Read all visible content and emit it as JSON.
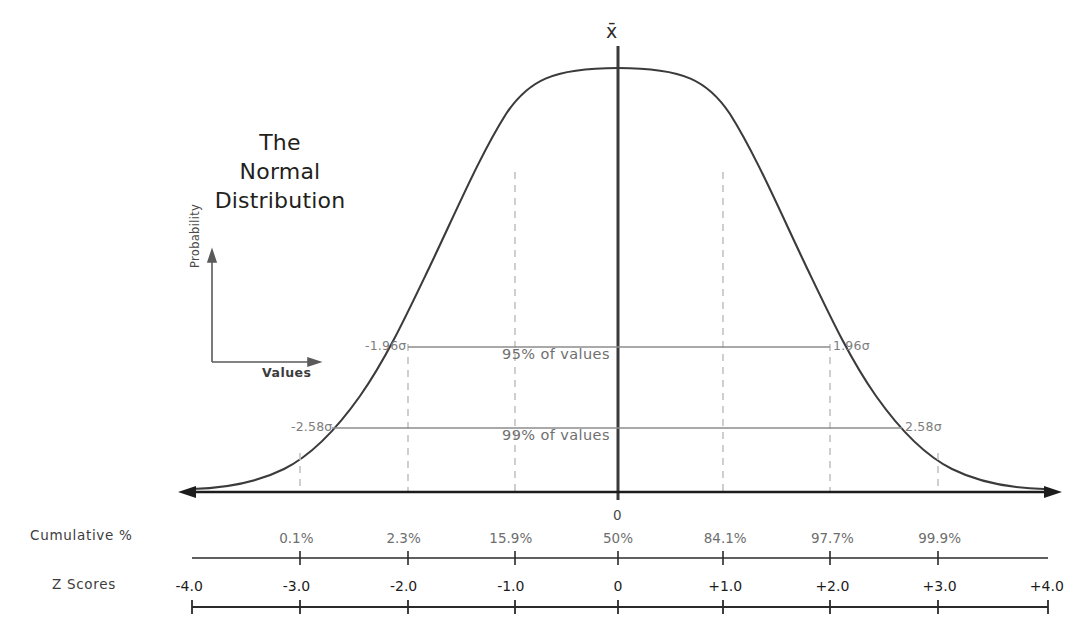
{
  "title": {
    "line1": "The",
    "line2": "Normal",
    "line3": "Distribution"
  },
  "mini_axes": {
    "ylabel": "Probability",
    "xlabel": "Values"
  },
  "annotations": {
    "mean_symbol": "x̄",
    "center_zero": "0",
    "band95_label": "95% of values",
    "band99_label": "99% of values",
    "sigma_neg_196": "-1.96σ",
    "sigma_pos_196": "1.96σ",
    "sigma_neg_258": "-2.58σ",
    "sigma_pos_258": "2.58σ"
  },
  "rows": {
    "cumulative_label": "Cumulative %",
    "zscores_label": "Z Scores"
  },
  "colors": {
    "curve": "#3b3b3b",
    "axis": "#1c1c1c",
    "gridline": "#c3c3c3",
    "band_line": "#8c8c8c",
    "text_dark": "#231f20",
    "text_gray": "#6e6e6e",
    "background": "#ffffff"
  },
  "chart_data": {
    "type": "line",
    "title": "The Normal Distribution",
    "xlabel": "Values",
    "ylabel": "Probability",
    "xlim": [
      -4.0,
      4.0
    ],
    "grid": true,
    "legend": null,
    "distribution": {
      "name": "standard normal",
      "mean": 0,
      "sd": 1,
      "peak_label": "x̄"
    },
    "z_scores": [
      "-4.0",
      "-3.0",
      "-2.0",
      "-1.0",
      "0",
      "+1.0",
      "+2.0",
      "+3.0",
      "+4.0"
    ],
    "z_values": [
      -4.0,
      -3.0,
      -2.0,
      -1.0,
      0,
      1.0,
      2.0,
      3.0,
      4.0
    ],
    "cumulative_percent_labels": [
      "0.1%",
      "2.3%",
      "15.9%",
      "50%",
      "84.1%",
      "97.7%",
      "99.9%"
    ],
    "cumulative_percent_values": [
      0.1,
      2.3,
      15.9,
      50,
      84.1,
      97.7,
      99.9
    ],
    "cumulative_percent_at_z": [
      -3.0,
      -2.0,
      -1.0,
      0,
      1.0,
      2.0,
      3.0
    ],
    "gridline_z_positions": [
      -3.0,
      -2.0,
      -1.0,
      1.0,
      2.0,
      3.0
    ],
    "confidence_bands": [
      {
        "label": "95% of values",
        "z_low": -1.96,
        "z_high": 1.96,
        "left_label": "-1.96σ",
        "right_label": "1.96σ"
      },
      {
        "label": "99% of values",
        "z_low": -2.58,
        "z_high": 2.58,
        "left_label": "-2.58σ",
        "right_label": "2.58σ"
      }
    ]
  }
}
